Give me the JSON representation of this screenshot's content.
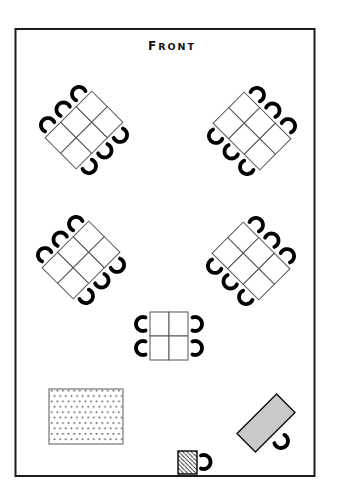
{
  "title": {
    "full": "FRONT",
    "first": "F",
    "rest": "RONT"
  },
  "colors": {
    "background": "#ffffff",
    "room_outline": "#1c1c1c",
    "table_line": "#555555",
    "table_fill": "#ffffff",
    "chair": "#000000",
    "gray_table_fill": "#c9c9c9",
    "rug_dot": "#555555",
    "hatch_line": "#222222"
  },
  "room": {
    "x": 15.5,
    "y": 29,
    "width": 299,
    "height": 447,
    "stroke_width": 2
  },
  "chair_style": {
    "radius": 7,
    "stroke_width": 3.8,
    "gap_deg": 138,
    "offset": 7
  },
  "tables": [
    {
      "name": "dining-table-top-left",
      "cx": 84,
      "cy": 130,
      "cols": 3,
      "rows": 2,
      "cell_w": 22,
      "cell_h": 22,
      "rotation": -45,
      "seat_sides": "top-bottom",
      "seats": 6
    },
    {
      "name": "dining-table-top-right",
      "cx": 252,
      "cy": 131,
      "cols": 3,
      "rows": 2,
      "cell_w": 22,
      "cell_h": 22,
      "rotation": 45,
      "seat_sides": "top-bottom",
      "seats": 6
    },
    {
      "name": "dining-table-middle-left",
      "cx": 81,
      "cy": 260,
      "cols": 3,
      "rows": 2,
      "cell_w": 22,
      "cell_h": 22,
      "rotation": -45,
      "seat_sides": "top-bottom",
      "seats": 6
    },
    {
      "name": "dining-table-middle-right",
      "cx": 251,
      "cy": 261,
      "cols": 3,
      "rows": 2,
      "cell_w": 22,
      "cell_h": 22,
      "rotation": 45,
      "seat_sides": "top-bottom",
      "seats": 6
    },
    {
      "name": "dining-table-center",
      "cx": 169,
      "cy": 336,
      "cols": 2,
      "rows": 2,
      "cell_w": 19,
      "cell_h": 24,
      "rotation": 0,
      "seat_sides": "left-right",
      "seats": 4
    }
  ],
  "furniture": [
    {
      "name": "dotted-rug",
      "type": "rect",
      "x": 49,
      "y": 389,
      "width": 74,
      "height": 55,
      "fill": "pattern-dots",
      "stroke": "#8a8a8a",
      "stroke_width": 1.4
    },
    {
      "name": "hatched-stand",
      "type": "rect",
      "x": 178,
      "y": 451,
      "width": 19,
      "height": 23,
      "fill": "pattern-hatch",
      "stroke": "#111111",
      "stroke_width": 1.5
    },
    {
      "name": "gray-table",
      "type": "rect-rotated",
      "cx": 266,
      "cy": 423,
      "width": 56,
      "height": 26,
      "rotation": -45,
      "fill": "#c9c9c9",
      "stroke": "#111111",
      "stroke_width": 1.4
    }
  ],
  "loose_chairs": [
    {
      "name": "chair-at-hatched-stand",
      "x": 203.5,
      "y": 462,
      "open_deg": 180
    },
    {
      "name": "chair-at-gray-table",
      "x": 281,
      "y": 441,
      "open_deg": 230
    }
  ]
}
